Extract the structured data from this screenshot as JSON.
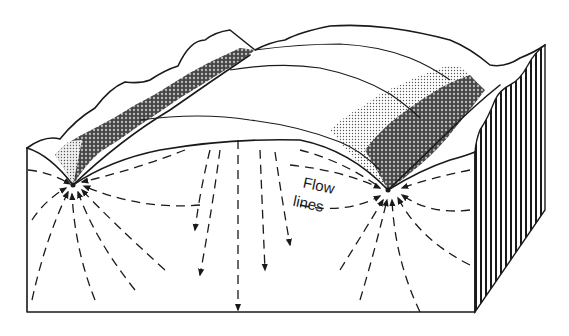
{
  "figure": {
    "labels": {
      "flow_lines_line1": "Flow",
      "flow_lines_line2": "lines"
    },
    "elements": {
      "front_face": "cross-section",
      "side_face": "hatched-side",
      "streams": [
        "left-stream",
        "right-stream"
      ],
      "hills": [
        "left-valley-slope",
        "central-hill",
        "right-valley-slope"
      ]
    },
    "colors": {
      "ink": "#1a1a1a",
      "background": "#ffffff",
      "shade_light": "#c8c8c8",
      "shade_mid": "#8a8a8a",
      "shade_dark": "#3a3a3a"
    }
  }
}
